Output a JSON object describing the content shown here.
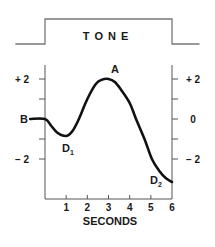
{
  "tone": {
    "label": "T O N E",
    "low_start_x_s": -1.4,
    "on_s": 0,
    "off_s": 6,
    "low_end_x_s": 1.3
  },
  "labels": {
    "baseline": "B",
    "peak": "A",
    "dip1": "D",
    "dip1_sub": "1",
    "dip2": "D",
    "dip2_sub": "2",
    "xlabel": "SECONDS"
  },
  "axes": {
    "left_ticks": [
      {
        "value": 2,
        "label": "+ 2"
      },
      {
        "value": 1,
        "label": ""
      },
      {
        "value": 0,
        "label": ""
      },
      {
        "value": -1,
        "label": ""
      },
      {
        "value": -2,
        "label": "− 2"
      }
    ],
    "right_ticks": [
      {
        "value": 2,
        "label": "+ 2"
      },
      {
        "value": 1,
        "label": ""
      },
      {
        "value": 0,
        "label": "0"
      },
      {
        "value": -1,
        "label": ""
      },
      {
        "value": -2,
        "label": "− 2"
      }
    ],
    "x_ticks": [
      "1",
      "2",
      "3",
      "4",
      "5",
      "6"
    ]
  },
  "chart_data": {
    "type": "line",
    "title": "",
    "xlabel": "SECONDS",
    "ylabel": "",
    "xlim": [
      0,
      6
    ],
    "ylim": [
      -4,
      2.7
    ],
    "grid": false,
    "annotations": [
      {
        "text": "B",
        "x": -0.55,
        "y": 0,
        "meaning": "baseline"
      },
      {
        "text": "D1",
        "x": 1.0,
        "y": -0.8
      },
      {
        "text": "A",
        "x": 3.0,
        "y": 2.0
      },
      {
        "text": "D2",
        "x": 6.0,
        "y": -3.1
      }
    ],
    "stimulus": {
      "label": "TONE",
      "on": 0,
      "off": 6
    },
    "series": [
      {
        "name": "response",
        "x": [
          -0.7,
          0.0,
          0.3,
          0.6,
          1.0,
          1.3,
          1.6,
          2.0,
          2.4,
          2.7,
          3.0,
          3.3,
          3.6,
          4.0,
          4.3,
          4.7,
          5.05,
          5.4,
          5.7,
          6.0
        ],
        "y": [
          0.0,
          0.0,
          -0.35,
          -0.7,
          -0.85,
          -0.6,
          0.0,
          1.0,
          1.75,
          1.97,
          2.0,
          1.85,
          1.45,
          0.8,
          0.0,
          -1.0,
          -2.0,
          -2.6,
          -2.95,
          -3.15
        ]
      }
    ]
  }
}
